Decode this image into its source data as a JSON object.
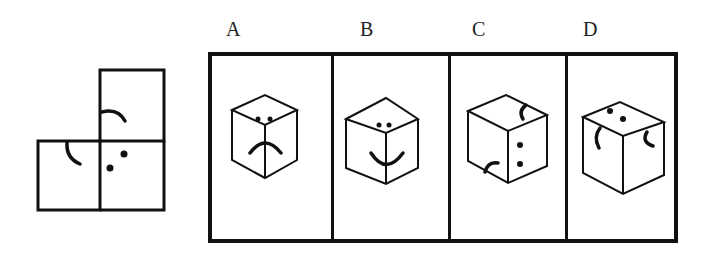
{
  "puzzle": {
    "net": {
      "description": "L-shaped unfolded cube net with three faces",
      "faces": [
        {
          "position": "top-right",
          "symbol": "arc"
        },
        {
          "position": "bottom-left",
          "symbol": "arc"
        },
        {
          "position": "bottom-right",
          "symbol": "two-dots"
        }
      ]
    },
    "options": [
      {
        "label": "A",
        "description": "Cube with two dots on top and frown arc spanning front faces"
      },
      {
        "label": "B",
        "description": "Cube with two dots on top and smile arc spanning front faces"
      },
      {
        "label": "C",
        "description": "Cube with arc on top, arc on left face, two dots on right face"
      },
      {
        "label": "D",
        "description": "Cube with two dots on top, arc on left face, arc on right face"
      }
    ]
  }
}
